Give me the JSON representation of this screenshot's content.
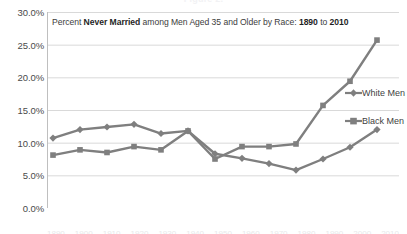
{
  "cut_header": "Figure 2.",
  "title": {
    "prefix": "Percent ",
    "bold1": "Never Married",
    "middle": " among Men Aged 35 and Older by Race: ",
    "bold2": "1890",
    "joiner": " to ",
    "bold3": "2010"
  },
  "axis": {
    "y_ticks": [
      "30.0%",
      "25.0%",
      "20.0%",
      "15.0%",
      "10.0%",
      "5.0%",
      "0.0%"
    ]
  },
  "legend": {
    "white_label": "White Men",
    "black_label": "Black Men",
    "white_marker": "diamond-marker",
    "black_marker": "square-marker"
  },
  "colors": {
    "series_line": "#7f7f7f",
    "gridline": "#d9d9d9",
    "axis_line": "#bfbfbf",
    "title_text": "#3c3c3c",
    "tick_text": "#4a4a4a",
    "background": "#ffffff"
  },
  "x_labels_cut": [
    "1890",
    "1900",
    "1910",
    "1920",
    "1930",
    "1940",
    "1950",
    "1960",
    "1970",
    "1980",
    "1990",
    "2000",
    "2010"
  ],
  "chart_data": {
    "type": "line",
    "title": "Percent Never Married among Men Aged 35 and Older by Race: 1890 to 2010",
    "xlabel": "",
    "ylabel": "",
    "ylim": [
      0,
      30
    ],
    "ytick_values": [
      0,
      5,
      10,
      15,
      20,
      25,
      30
    ],
    "ytick_format": "percent",
    "grid": true,
    "legend_position": "right",
    "x": [
      "1890",
      "1900",
      "1910",
      "1920",
      "1930",
      "1940",
      "1950",
      "1960",
      "1970",
      "1980",
      "1990",
      "2000",
      "2010"
    ],
    "categories": [
      "1890",
      "1900",
      "1910",
      "1920",
      "1930",
      "1940",
      "1950",
      "1960",
      "1970",
      "1980",
      "1990",
      "2000",
      "2010"
    ],
    "series": [
      {
        "name": "White Men",
        "marker": "diamond",
        "color": "#7f7f7f",
        "values": [
          10.7,
          12.0,
          12.4,
          12.8,
          11.4,
          11.8,
          8.3,
          7.6,
          6.8,
          5.8,
          7.5,
          9.3,
          12.0
        ]
      },
      {
        "name": "Black Men",
        "marker": "square",
        "color": "#7f7f7f",
        "values": [
          8.1,
          8.9,
          8.5,
          9.4,
          8.9,
          11.8,
          7.5,
          9.4,
          9.4,
          9.8,
          15.7,
          19.4,
          25.7
        ]
      }
    ]
  }
}
